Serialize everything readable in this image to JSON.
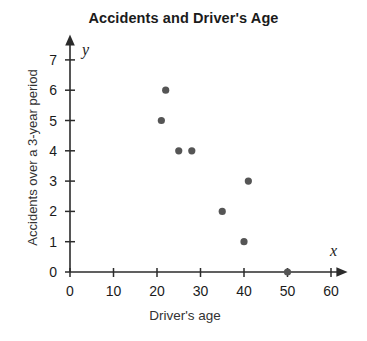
{
  "chart_data": {
    "type": "scatter",
    "title": "Accidents and Driver's Age",
    "xlabel": "Driver's age",
    "ylabel": "Accidents over a 3-year period",
    "xlim": [
      0,
      65
    ],
    "ylim": [
      0,
      7.6
    ],
    "xticks": [
      0,
      10,
      20,
      30,
      40,
      50,
      60
    ],
    "xtick_labels": [
      "0",
      "10",
      "20",
      "30",
      "40",
      "50",
      "60"
    ],
    "yticks": [
      0,
      1,
      2,
      3,
      4,
      5,
      6,
      7
    ],
    "ytick_labels": [
      "0",
      "1",
      "2",
      "3",
      "4",
      "5",
      "6",
      "7"
    ],
    "grid": false,
    "legend": null,
    "x_axis_variable": "x",
    "y_axis_variable": "y",
    "marker_color": "#555555",
    "marker_radius": 3.6,
    "points": [
      {
        "x": 22,
        "y": 6
      },
      {
        "x": 21,
        "y": 5
      },
      {
        "x": 25,
        "y": 4
      },
      {
        "x": 28,
        "y": 4
      },
      {
        "x": 41,
        "y": 3
      },
      {
        "x": 35,
        "y": 2
      },
      {
        "x": 40,
        "y": 1
      },
      {
        "x": 50,
        "y": 0
      }
    ]
  }
}
